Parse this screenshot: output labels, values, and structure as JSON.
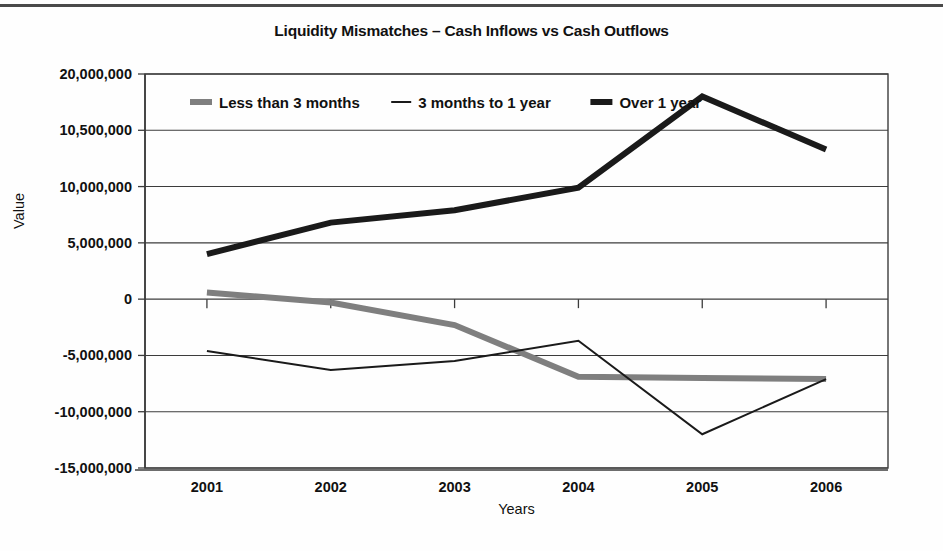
{
  "chart_data": {
    "type": "line",
    "title": "Liquidity Mismatches – Cash Inflows vs Cash Outflows",
    "xlabel": "Years",
    "ylabel": "Value",
    "categories": [
      "2001",
      "2002",
      "2003",
      "2004",
      "2005",
      "2006"
    ],
    "x": [
      2001,
      2002,
      2003,
      2004,
      2005,
      2006
    ],
    "ylim": [
      -15000000,
      20000000
    ],
    "ytick_labels": [
      "20,000,000",
      "10,500,000",
      "10,000,000",
      "5,000,000",
      "0",
      "-5,000,000",
      "-10,000,000",
      "-15,000,000"
    ],
    "ytick_values": [
      20000000,
      15000000,
      10000000,
      5000000,
      0,
      -5000000,
      -10000000,
      -15000000
    ],
    "grid": true,
    "legend_position": "top-inside-left",
    "series": [
      {
        "name": "Less than 3 months",
        "color": "#7f7f7f",
        "width": 6,
        "values": [
          600000,
          -300000,
          -2300000,
          -6900000,
          -7000000,
          -7100000
        ]
      },
      {
        "name": "3 months to 1 year",
        "color": "#1a1a1a",
        "width": 2,
        "values": [
          -4600000,
          -6300000,
          -5500000,
          -3700000,
          -12000000,
          -7100000
        ]
      },
      {
        "name": "Over 1 year",
        "color": "#1a1a1a",
        "width": 6,
        "values": [
          4000000,
          6800000,
          7900000,
          9900000,
          18000000,
          13300000
        ]
      }
    ]
  },
  "legend": {
    "entries": [
      {
        "label": "Less than 3 months"
      },
      {
        "label": "3 months to 1 year"
      },
      {
        "label": "Over 1 year"
      }
    ]
  },
  "colors": {
    "gray_series": "#7f7f7f",
    "black_series": "#1a1a1a",
    "axis": "#3c3c3c",
    "background": "#fefefe"
  }
}
